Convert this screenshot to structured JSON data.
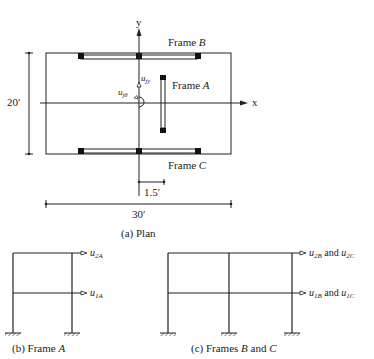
{
  "plan": {
    "caption": "(a) Plan",
    "axis_x_label": "x",
    "axis_y_label": "y",
    "frame_b_label": "Frame ",
    "frame_b_letter": "B",
    "frame_a_label": "Frame ",
    "frame_a_letter": "A",
    "frame_c_label": "Frame ",
    "frame_c_letter": "C",
    "dof_uy": "u",
    "dof_uy_sub": "jy",
    "dof_utheta": "u",
    "dof_utheta_sub": "jθ",
    "dim_height": "20′",
    "dim_width": "30′",
    "dim_offset": "1.5′"
  },
  "frame_a": {
    "caption_prefix": "(b) Frame ",
    "caption_letter": "A",
    "dof_top": "u",
    "dof_top_sub": "2A",
    "dof_mid": "u",
    "dof_mid_sub": "1A"
  },
  "frames_bc": {
    "caption_prefix": "(c) Frames ",
    "caption_b": "B",
    "caption_and": " and ",
    "caption_c": "C",
    "dof_top_1": "u",
    "dof_top_1_sub": "2B",
    "dof_top_and": " and ",
    "dof_top_2": "u",
    "dof_top_2_sub": "2C",
    "dof_mid_1": "u",
    "dof_mid_1_sub": "1B",
    "dof_mid_and": " and ",
    "dof_mid_2": "u",
    "dof_mid_2_sub": "1C"
  }
}
